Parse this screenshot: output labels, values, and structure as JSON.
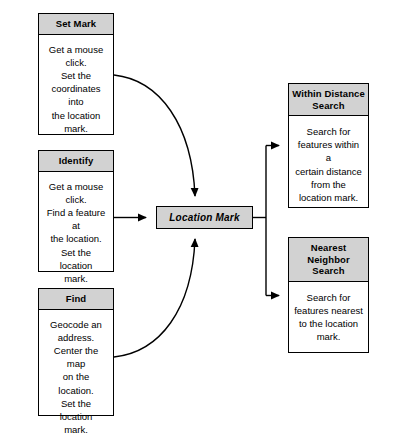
{
  "diagram": {
    "colors": {
      "header_fill": "#d2d2d2",
      "body_fill": "#ffffff",
      "stroke": "#000000",
      "background": "#ffffff"
    },
    "central_node": {
      "label": "Location Mark"
    },
    "inputs": [
      {
        "id": "set-mark",
        "header": "Set Mark",
        "body": "Get a mouse click.\nSet the\ncoordinates into\nthe location\nmark."
      },
      {
        "id": "identify",
        "header": "Identify",
        "body": "Get a mouse click.\nFind a feature at\nthe location.\nSet the location\nmark."
      },
      {
        "id": "find",
        "header": "Find",
        "body": "Geocode an address.\nCenter the map\non the location.\nSet the location\nmark."
      }
    ],
    "outputs": [
      {
        "id": "within-distance-search",
        "header": "Within\nDistance\nSearch",
        "body": "Search for\nfeatures within a\ncertain distance\nfrom the\nlocation mark."
      },
      {
        "id": "nearest-neighbor-search",
        "header": "Nearest\nNeighbor\nSearch",
        "body": "Search for\nfeatures nearest\nto the location\nmark."
      }
    ],
    "connectors": [
      {
        "from": "set-mark",
        "to": "location-mark",
        "style": "curved",
        "arrowhead": true
      },
      {
        "from": "identify",
        "to": "location-mark",
        "style": "straight",
        "arrowhead": true
      },
      {
        "from": "find",
        "to": "location-mark",
        "style": "curved",
        "arrowhead": true
      },
      {
        "from": "location-mark",
        "to": "within-distance-search",
        "style": "orthogonal",
        "arrowhead": true
      },
      {
        "from": "location-mark",
        "to": "nearest-neighbor-search",
        "style": "orthogonal",
        "arrowhead": true
      }
    ]
  }
}
